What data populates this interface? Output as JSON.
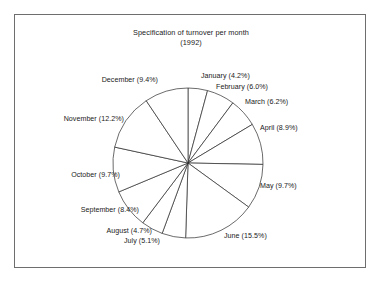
{
  "figure": {
    "title_line1": "Specification of turnover per month",
    "title_line2": "(1992)",
    "frame_color": "#6e6e6e",
    "background_color": "#ffffff",
    "outline_color": "#2b2b2b",
    "slice_fill_color": "#ffffff"
  },
  "chart_data": {
    "type": "pie",
    "title": "Specification of turnover per month (1992)",
    "subtitle": "(1992)",
    "xlabel": "",
    "ylabel": "",
    "unit": "%",
    "start_angle_deg": 90,
    "direction": "clockwise",
    "legend": "none",
    "grid": false,
    "categories": [
      "January",
      "February",
      "March",
      "April",
      "May",
      "June",
      "July",
      "August",
      "September",
      "October",
      "November",
      "December"
    ],
    "values": [
      4.2,
      6.0,
      6.2,
      8.9,
      9.7,
      15.5,
      5.1,
      4.7,
      8.4,
      9.7,
      12.2,
      9.4
    ],
    "total": 100.0,
    "slices": [
      {
        "label": "January",
        "value": 4.2,
        "label_text": "January (4.2%)",
        "label_x": 201,
        "label_y": 78,
        "anchor": "start"
      },
      {
        "label": "February",
        "value": 6.0,
        "label_text": "February (6.0%)",
        "label_x": 216,
        "label_y": 89,
        "anchor": "start"
      },
      {
        "label": "March",
        "value": 6.2,
        "label_text": "March (6.2%)",
        "label_x": 245,
        "label_y": 104,
        "anchor": "start"
      },
      {
        "label": "April",
        "value": 8.9,
        "label_text": "April (8.9%)",
        "label_x": 260,
        "label_y": 130,
        "anchor": "start"
      },
      {
        "label": "May",
        "value": 9.7,
        "label_text": "May (9.7%)",
        "label_x": 260,
        "label_y": 188,
        "anchor": "start"
      },
      {
        "label": "June",
        "value": 15.5,
        "label_text": "June (15.5%)",
        "label_x": 224,
        "label_y": 238,
        "anchor": "start"
      },
      {
        "label": "July",
        "value": 5.1,
        "label_text": "July (5.1%)",
        "label_x": 160,
        "label_y": 243,
        "anchor": "end"
      },
      {
        "label": "August",
        "value": 4.7,
        "label_text": "August (4.7%)",
        "label_x": 152,
        "label_y": 233,
        "anchor": "end"
      },
      {
        "label": "September",
        "value": 8.4,
        "label_text": "September (8.4%)",
        "label_x": 139,
        "label_y": 212,
        "anchor": "end"
      },
      {
        "label": "October",
        "value": 9.7,
        "label_text": "October (9.7%)",
        "label_x": 120,
        "label_y": 177,
        "anchor": "end"
      },
      {
        "label": "November",
        "value": 12.2,
        "label_text": "November (12.2%)",
        "label_x": 124,
        "label_y": 121,
        "anchor": "end"
      },
      {
        "label": "December",
        "value": 9.4,
        "label_text": "December (9.4%)",
        "label_x": 158,
        "label_y": 82,
        "anchor": "end"
      }
    ],
    "geometry": {
      "center_x": 188,
      "center_y": 163,
      "radius": 75
    }
  }
}
